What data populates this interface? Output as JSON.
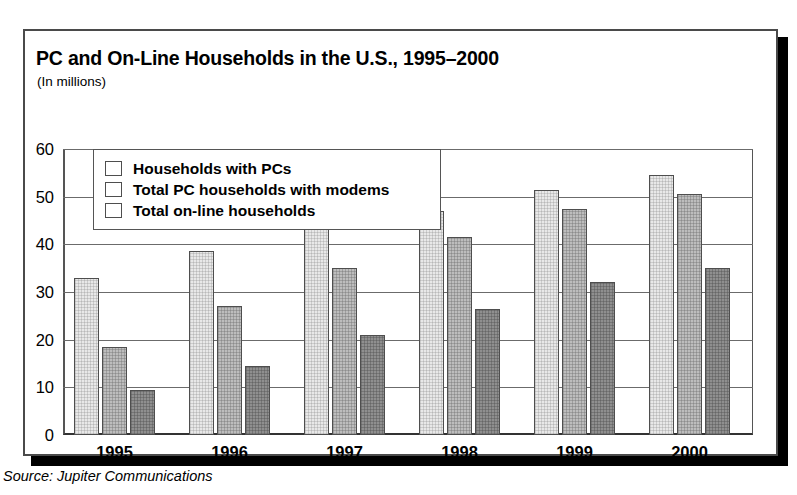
{
  "chart_data": {
    "type": "bar",
    "title": "PC and On-Line Households in the U.S., 1995–2000",
    "subtitle": "(In millions)",
    "xlabel": "",
    "ylabel": "",
    "ylim": [
      0,
      60
    ],
    "yticks": [
      0,
      10,
      20,
      30,
      40,
      50,
      60
    ],
    "grid": true,
    "legend_position": "upper-left-inside",
    "categories": [
      "1995",
      "1996",
      "1997",
      "1998",
      "1999",
      "2000"
    ],
    "series": [
      {
        "name": "Households with PCs",
        "color": "#e8e8e8",
        "values": [
          33,
          38.5,
          43.5,
          47,
          51.5,
          54.5
        ]
      },
      {
        "name": "Total PC households with modems",
        "color": "#bdbdbd",
        "values": [
          18.5,
          27,
          35,
          41.5,
          47.5,
          50.5
        ]
      },
      {
        "name": "Total on-line households",
        "color": "#8f8f8f",
        "values": [
          9.5,
          14.5,
          21,
          26.5,
          32,
          35
        ]
      }
    ]
  },
  "source": {
    "text": "Source: Jupiter Communications"
  }
}
